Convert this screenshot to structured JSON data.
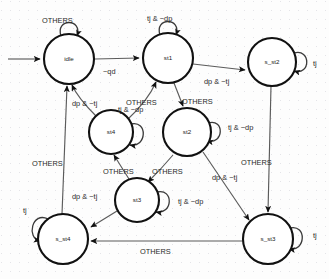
{
  "diagram": {
    "type": "state-machine",
    "states": [
      {
        "id": "idle",
        "label": "idle",
        "cx": 69,
        "cy": 59,
        "r": 25
      },
      {
        "id": "st1",
        "label": "st1",
        "cx": 168,
        "cy": 58,
        "r": 25
      },
      {
        "id": "s_st2",
        "label": "s_st2",
        "cx": 272,
        "cy": 62,
        "r": 24
      },
      {
        "id": "st4",
        "label": "st4",
        "cx": 111,
        "cy": 132,
        "r": 22
      },
      {
        "id": "st2",
        "label": "st2",
        "cx": 187,
        "cy": 132,
        "r": 24
      },
      {
        "id": "st3",
        "label": "st3",
        "cx": 137,
        "cy": 200,
        "r": 22
      },
      {
        "id": "s_st4",
        "label": "s_st4",
        "cx": 63,
        "cy": 239,
        "r": 25
      },
      {
        "id": "s_st3",
        "label": "s_st3",
        "cx": 268,
        "cy": 239,
        "r": 25
      }
    ],
    "self_loops": [
      {
        "state": "idle",
        "label": "OTHERS",
        "label_x": 42,
        "label_y": 23
      },
      {
        "state": "st1",
        "label": "tj & ~dp",
        "label_x": 147,
        "label_y": 21
      },
      {
        "state": "s_st2",
        "label": "tj",
        "label_x": 305,
        "label_y": 66
      },
      {
        "state": "st4",
        "label": "tj & ~dp",
        "label_x": 118,
        "label_y": 112
      },
      {
        "state": "st2",
        "label": "tj & ~dp",
        "label_x": 226,
        "label_y": 130
      },
      {
        "state": "st3",
        "label": "tj & ~dp",
        "label_x": 178,
        "label_y": 203
      },
      {
        "state": "s_st4",
        "label": "tj",
        "label_x": 25,
        "label_y": 213
      },
      {
        "state": "s_st3",
        "label": "tj",
        "label_x": 311,
        "label_y": 238
      }
    ],
    "transitions": [
      {
        "from": "start",
        "to": "idle",
        "label": "",
        "label_x": 0,
        "label_y": 0
      },
      {
        "from": "idle",
        "to": "st1",
        "label": "~qd",
        "label_x": 103,
        "label_y": 74
      },
      {
        "from": "st1",
        "to": "s_st2",
        "label": "dp & ~tj",
        "label_x": 206,
        "label_y": 83
      },
      {
        "from": "st1",
        "to": "st2",
        "label": "OTHERS",
        "label_x": 181,
        "label_y": 103
      },
      {
        "from": "st4",
        "to": "idle",
        "label": "dp & ~tj",
        "label_x": 78,
        "label_y": 104
      },
      {
        "from": "st4",
        "to": "st1",
        "label": "OTHERS",
        "label_x": 127,
        "label_y": 104
      },
      {
        "from": "s_st2",
        "to": "s_st3",
        "label": "OTHERS",
        "label_x": 244,
        "label_y": 163
      },
      {
        "from": "st2",
        "to": "s_st3",
        "label": "dp & ~tj",
        "label_x": 217,
        "label_y": 178
      },
      {
        "from": "st2",
        "to": "st3",
        "label": "OTHERS",
        "label_x": 156,
        "label_y": 172
      },
      {
        "from": "st3",
        "to": "st4",
        "label": "OTHERS",
        "label_x": 110,
        "label_y": 172
      },
      {
        "from": "st3",
        "to": "s_st4",
        "label": "dp & ~tj",
        "label_x": 76,
        "label_y": 197
      },
      {
        "from": "s_st3",
        "to": "s_st4",
        "label": "OTHERS",
        "label_x": 144,
        "label_y": 252
      },
      {
        "from": "s_st4",
        "to": "idle",
        "label": "OTHERS",
        "label_x": 36,
        "label_y": 164
      }
    ]
  }
}
